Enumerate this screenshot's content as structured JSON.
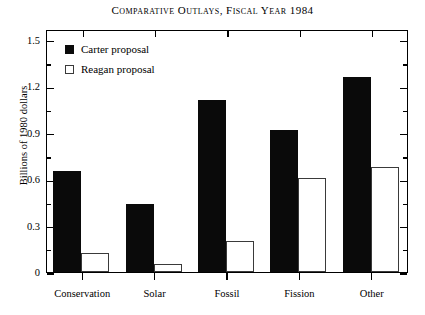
{
  "chart_data": {
    "type": "bar",
    "title": "Comparative Outlays, Fiscal Year 1984",
    "xlabel": "",
    "ylabel": "Billions of 1980 dollars",
    "categories": [
      "Conservation",
      "Solar",
      "Fossil",
      "Fission",
      "Other"
    ],
    "series": [
      {
        "name": "Carter proposal",
        "values": [
          0.65,
          0.44,
          1.11,
          0.92,
          1.26
        ],
        "color": "#0a0a0a",
        "style": "filled"
      },
      {
        "name": "Reagan proposal",
        "values": [
          0.12,
          0.05,
          0.2,
          0.61,
          0.68
        ],
        "color": "#ffffff",
        "style": "hollow"
      }
    ],
    "ylim": [
      0,
      1.57
    ],
    "ytick_values": [
      0,
      0.3,
      0.6,
      0.9,
      1.2,
      1.5
    ],
    "ytick_labels": [
      "0",
      "0.3",
      "0.6",
      "0.9",
      "1.2",
      "1.5"
    ],
    "yminor_interval": 0.15,
    "grid": false,
    "legend_position": "top-left-inside",
    "frame": "full-box"
  },
  "legend": {
    "entries": [
      {
        "label": "Carter proposal",
        "swatch": "filled-square"
      },
      {
        "label": "Reagan proposal",
        "swatch": "hollow-square"
      }
    ]
  }
}
